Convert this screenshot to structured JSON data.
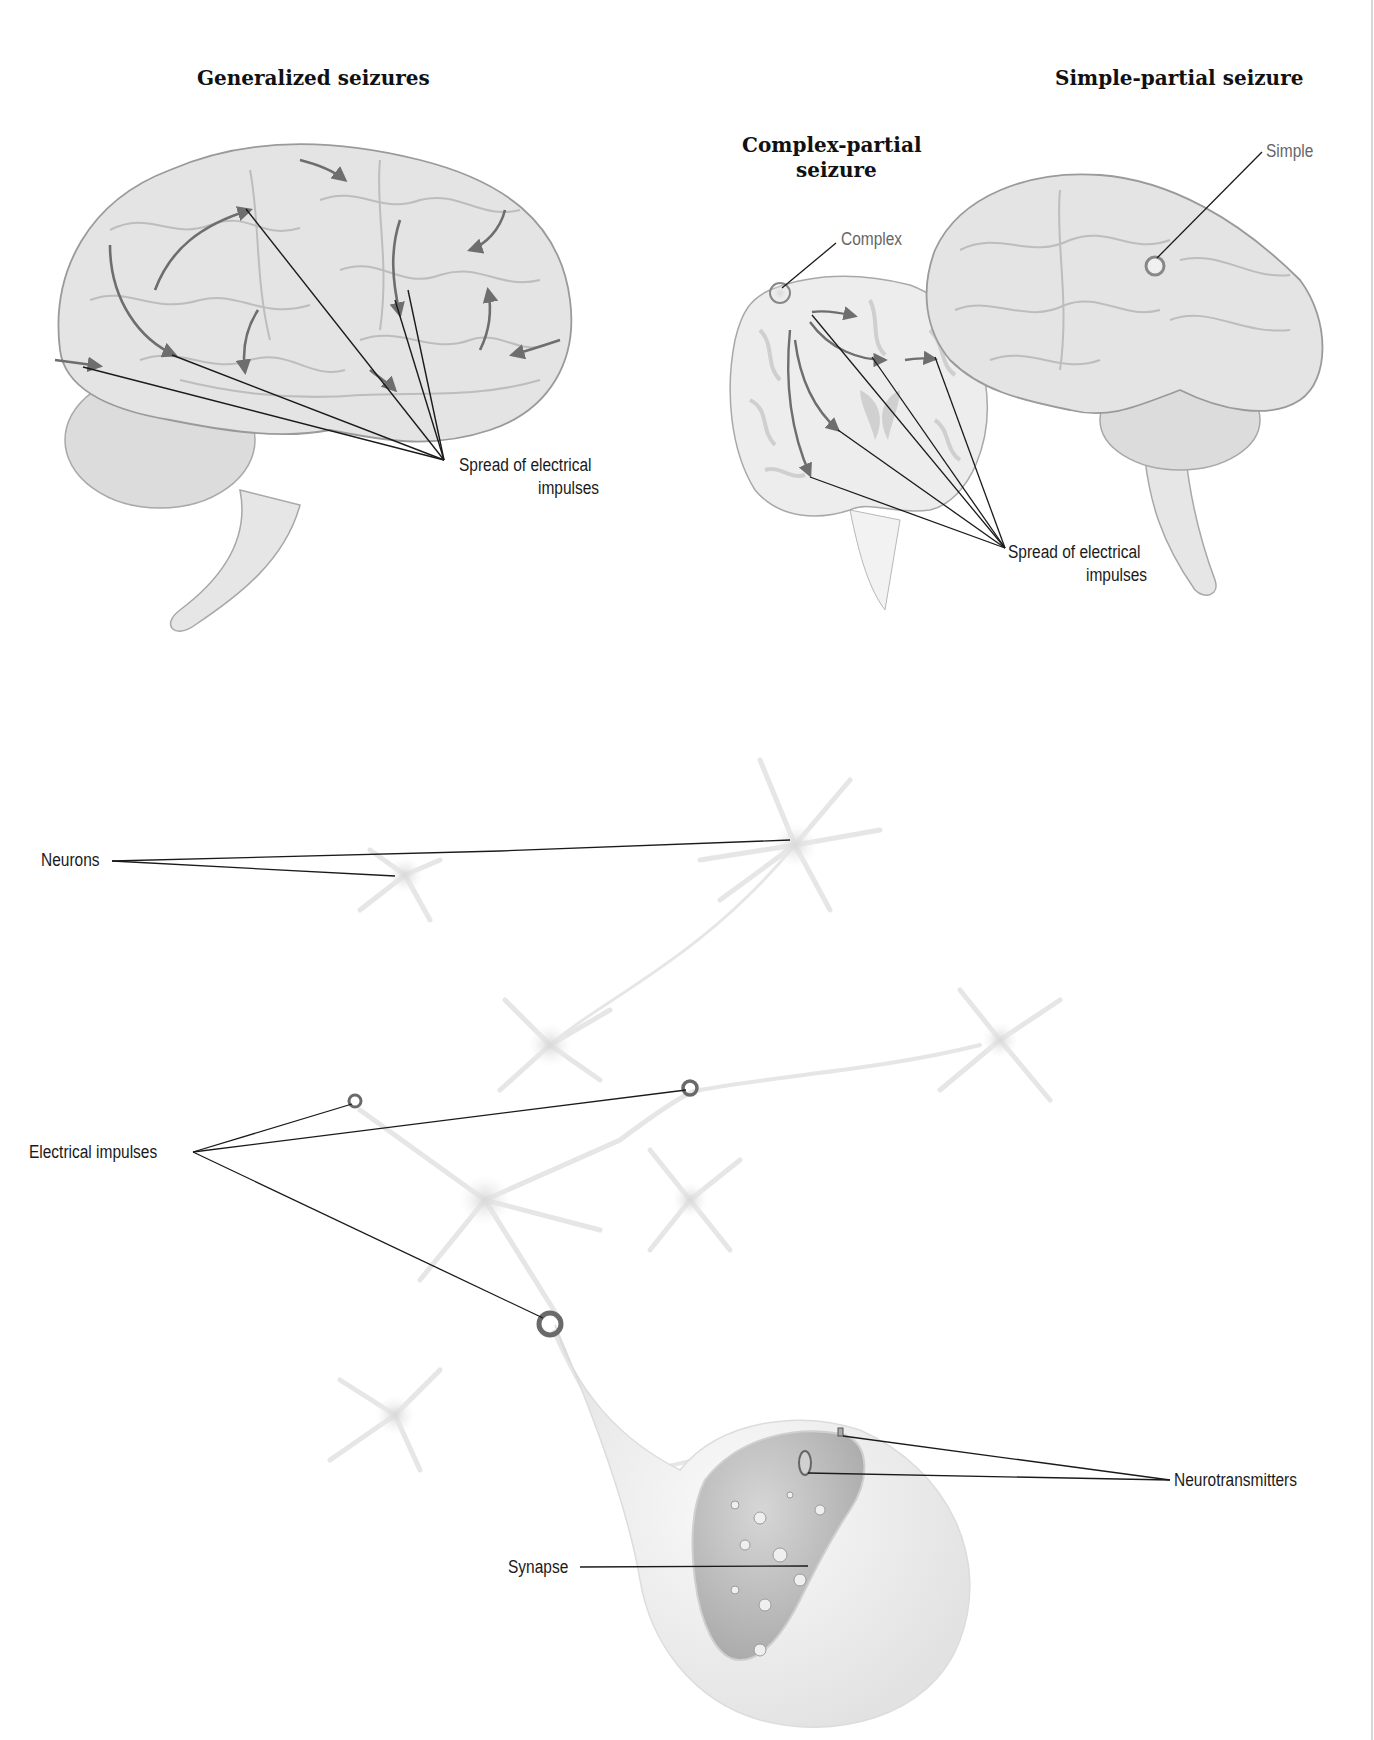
{
  "titles": {
    "generalized": "Generalized seizures",
    "simple_partial": "Simple-partial seizure",
    "complex_partial_line1": "Complex-partial",
    "complex_partial_line2": "seizure"
  },
  "labels": {
    "simple": "Simple",
    "complex": "Complex",
    "spread_left_line1": "Spread of electrical",
    "spread_left_line2": "impulses",
    "spread_right_line1": "Spread of electrical",
    "spread_right_line2": "impulses",
    "neurons": "Neurons",
    "electrical_impulses": "Electrical impulses",
    "neurotransmitters": "Neurotransmitters",
    "synapse": "Synapse"
  },
  "colors": {
    "brain_fill": "#e4e4e4",
    "brain_stroke": "#9a9a9a",
    "arrow": "#6e6e6e",
    "leader": "#1a1a1a",
    "neuron": "#ececec"
  }
}
